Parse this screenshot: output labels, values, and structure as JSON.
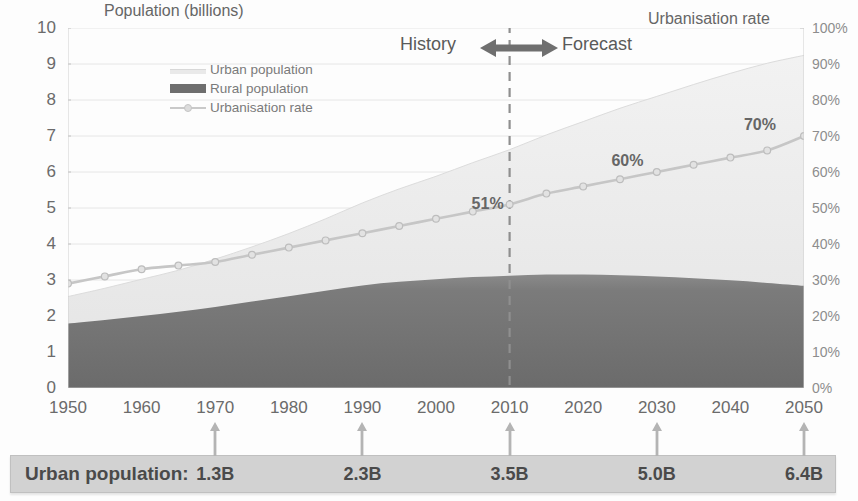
{
  "axis_titles": {
    "left": "Population (billions)",
    "right": "Urbanisation rate"
  },
  "annotations": {
    "history": "History",
    "forecast": "Forecast",
    "divider_year": 2010
  },
  "legend": {
    "items": [
      {
        "label": "Urban population",
        "swatch": "urban-area-swatch",
        "color": "#e9e9e9"
      },
      {
        "label": "Rural population",
        "swatch": "rural-area-swatch",
        "color": "#6e6e6e"
      },
      {
        "label": "Urbanisation rate",
        "swatch": "rate-line-swatch",
        "color": "#c9c9c9"
      }
    ]
  },
  "callouts": [
    {
      "text": "51%",
      "year": 2010,
      "value": 51
    },
    {
      "text": "60%",
      "year": 2029,
      "value": 63
    },
    {
      "text": "70%",
      "year": 2047,
      "value": 73
    }
  ],
  "bottom_bar": {
    "label": "Urban population:",
    "entries": [
      {
        "year": 1970,
        "value": "1.3B"
      },
      {
        "year": 1990,
        "value": "2.3B"
      },
      {
        "year": 2010,
        "value": "3.5B"
      },
      {
        "year": 2030,
        "value": "5.0B"
      },
      {
        "year": 2050,
        "value": "6.4B"
      }
    ]
  },
  "chart_data": {
    "type": "area",
    "title": "",
    "xlabel": "",
    "ylabel": "Population (billions)",
    "y2label": "Urbanisation rate",
    "xlim": [
      1950,
      2050
    ],
    "ylim": [
      0,
      10
    ],
    "y2lim": [
      0,
      100
    ],
    "grid": true,
    "legend_position": "upper-left-inside",
    "x_ticks": [
      1950,
      1960,
      1970,
      1980,
      1990,
      2000,
      2010,
      2020,
      2030,
      2040,
      2050
    ],
    "x_minor_tick_step": 5,
    "y_ticks": [
      0,
      1,
      2,
      3,
      4,
      5,
      6,
      7,
      8,
      9,
      10
    ],
    "y2_ticks": [
      "0%",
      "10%",
      "20%",
      "30%",
      "40%",
      "50%",
      "60%",
      "70%",
      "80%",
      "90%",
      "100%"
    ],
    "x": [
      1950,
      1955,
      1960,
      1965,
      1970,
      1975,
      1980,
      1985,
      1990,
      1995,
      2000,
      2005,
      2010,
      2015,
      2020,
      2025,
      2030,
      2035,
      2040,
      2045,
      2050
    ],
    "series": [
      {
        "name": "Rural population",
        "type": "area-stacked",
        "color": "#6e6e6e",
        "values": [
          1.79,
          1.89,
          2.0,
          2.12,
          2.25,
          2.4,
          2.55,
          2.7,
          2.85,
          2.95,
          3.02,
          3.08,
          3.12,
          3.15,
          3.15,
          3.13,
          3.1,
          3.05,
          2.99,
          2.92,
          2.84
        ]
      },
      {
        "name": "Urban population",
        "type": "area-stacked",
        "color": "#e9e9e9",
        "values": [
          0.75,
          0.88,
          1.02,
          1.15,
          1.33,
          1.52,
          1.74,
          2.0,
          2.29,
          2.58,
          2.86,
          3.18,
          3.5,
          3.88,
          4.25,
          4.64,
          5.0,
          5.38,
          5.75,
          6.1,
          6.4
        ]
      },
      {
        "name": "Total population",
        "type": "computed-stack-top",
        "values": [
          2.54,
          2.77,
          3.02,
          3.27,
          3.58,
          3.92,
          4.29,
          4.7,
          5.14,
          5.53,
          5.88,
          6.26,
          6.62,
          7.03,
          7.4,
          7.77,
          8.1,
          8.43,
          8.74,
          9.02,
          9.24
        ]
      },
      {
        "name": "Urbanisation rate",
        "type": "line",
        "axis": "y2",
        "color": "#c9c9c9",
        "marker": "circle",
        "values": [
          29,
          31,
          33,
          34,
          35,
          37,
          39,
          41,
          43,
          45,
          47,
          49,
          51,
          54,
          56,
          58,
          60,
          62,
          64,
          66,
          70
        ]
      }
    ]
  }
}
